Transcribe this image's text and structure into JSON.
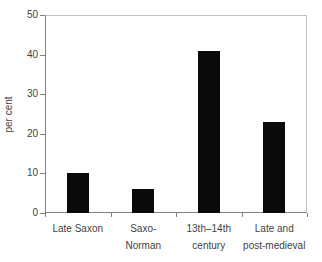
{
  "chart_data": {
    "type": "bar",
    "categories": [
      "Late Saxon",
      "Saxo-\nNorman",
      "13th–14th\ncentury",
      "Late and\npost-medieval"
    ],
    "values": [
      10,
      6,
      41,
      23
    ],
    "title": "",
    "xlabel": "",
    "ylabel": "per cent",
    "ylim": [
      0,
      50
    ],
    "ytick_step": 10,
    "ytick_labels": [
      "0",
      "10",
      "20",
      "30",
      "40",
      "50"
    ],
    "grid": false,
    "legend_position": "none",
    "bar_color": "#0a0a0a",
    "axis_color": "#808080",
    "frame_color": "#c0c0c0",
    "text_color": "#3f3f3f",
    "background_color": "#ffffff"
  }
}
